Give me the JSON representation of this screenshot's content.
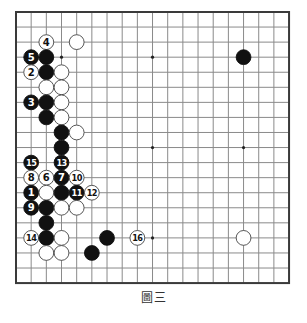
{
  "board": {
    "size": 19,
    "origin": [
      16,
      12
    ],
    "spacing": [
      15.17,
      15.06
    ],
    "stone_radius": 7.4,
    "line_color": "#8a8a8a",
    "border_color": "#3a3a3a",
    "star_points": [
      [
        3,
        3
      ],
      [
        9,
        3
      ],
      [
        15,
        3
      ],
      [
        3,
        9
      ],
      [
        9,
        9
      ],
      [
        15,
        9
      ],
      [
        3,
        15
      ],
      [
        9,
        15
      ],
      [
        15,
        15
      ]
    ]
  },
  "stones": [
    {
      "color": "white",
      "col": 2,
      "row": 2,
      "label": "4"
    },
    {
      "color": "white",
      "col": 4,
      "row": 2,
      "label": ""
    },
    {
      "color": "black",
      "col": 1,
      "row": 3,
      "label": "5"
    },
    {
      "color": "black",
      "col": 2,
      "row": 3,
      "label": ""
    },
    {
      "color": "black",
      "col": 15,
      "row": 3,
      "label": ""
    },
    {
      "color": "white",
      "col": 1,
      "row": 4,
      "label": "2"
    },
    {
      "color": "black",
      "col": 2,
      "row": 4,
      "label": ""
    },
    {
      "color": "white",
      "col": 3,
      "row": 4,
      "label": ""
    },
    {
      "color": "white",
      "col": 2,
      "row": 5,
      "label": ""
    },
    {
      "color": "white",
      "col": 3,
      "row": 5,
      "label": ""
    },
    {
      "color": "black",
      "col": 1,
      "row": 6,
      "label": "3"
    },
    {
      "color": "black",
      "col": 2,
      "row": 6,
      "label": ""
    },
    {
      "color": "white",
      "col": 3,
      "row": 6,
      "label": ""
    },
    {
      "color": "black",
      "col": 2,
      "row": 7,
      "label": ""
    },
    {
      "color": "white",
      "col": 3,
      "row": 7,
      "label": ""
    },
    {
      "color": "black",
      "col": 3,
      "row": 8,
      "label": ""
    },
    {
      "color": "white",
      "col": 4,
      "row": 8,
      "label": ""
    },
    {
      "color": "black",
      "col": 3,
      "row": 9,
      "label": ""
    },
    {
      "color": "black",
      "col": 1,
      "row": 10,
      "label": "15"
    },
    {
      "color": "black",
      "col": 3,
      "row": 10,
      "label": "13"
    },
    {
      "color": "white",
      "col": 1,
      "row": 11,
      "label": "8"
    },
    {
      "color": "white",
      "col": 2,
      "row": 11,
      "label": "6"
    },
    {
      "color": "black",
      "col": 3,
      "row": 11,
      "label": "7"
    },
    {
      "color": "white",
      "col": 4,
      "row": 11,
      "label": "10"
    },
    {
      "color": "black",
      "col": 1,
      "row": 12,
      "label": "1"
    },
    {
      "color": "white",
      "col": 2,
      "row": 12,
      "label": ""
    },
    {
      "color": "black",
      "col": 3,
      "row": 12,
      "label": ""
    },
    {
      "color": "black",
      "col": 4,
      "row": 12,
      "label": "11"
    },
    {
      "color": "white",
      "col": 5,
      "row": 12,
      "label": "12"
    },
    {
      "color": "black",
      "col": 1,
      "row": 13,
      "label": "9"
    },
    {
      "color": "black",
      "col": 2,
      "row": 13,
      "label": ""
    },
    {
      "color": "white",
      "col": 3,
      "row": 13,
      "label": ""
    },
    {
      "color": "white",
      "col": 4,
      "row": 13,
      "label": ""
    },
    {
      "color": "black",
      "col": 2,
      "row": 14,
      "label": ""
    },
    {
      "color": "white",
      "col": 1,
      "row": 15,
      "label": "14"
    },
    {
      "color": "black",
      "col": 2,
      "row": 15,
      "label": ""
    },
    {
      "color": "white",
      "col": 3,
      "row": 15,
      "label": ""
    },
    {
      "color": "black",
      "col": 6,
      "row": 15,
      "label": ""
    },
    {
      "color": "white",
      "col": 8,
      "row": 15,
      "label": "16"
    },
    {
      "color": "white",
      "col": 15,
      "row": 15,
      "label": ""
    },
    {
      "color": "white",
      "col": 2,
      "row": 16,
      "label": ""
    },
    {
      "color": "white",
      "col": 3,
      "row": 16,
      "label": ""
    },
    {
      "color": "black",
      "col": 5,
      "row": 16,
      "label": ""
    }
  ],
  "caption": "圖三"
}
